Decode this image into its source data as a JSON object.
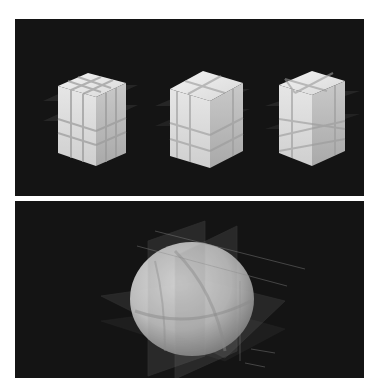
{
  "figure": {
    "background": "#ffffff",
    "panel_background": "#141414",
    "panels": [
      {
        "id": "top",
        "description": "Three cubes sliced by translucent planes",
        "objects": [
          {
            "shape": "cube",
            "variant": "axis-aligned 3x3 slicing",
            "face_color": "#e6e6e6"
          },
          {
            "shape": "cube",
            "variant": "offset slicing planes",
            "face_color": "#e2e2e2"
          },
          {
            "shape": "cube",
            "variant": "diagonal slicing planes",
            "face_color": "#e4e4e4"
          }
        ]
      },
      {
        "id": "bottom",
        "description": "Ellipsoid/sphere sliced by translucent orthogonal planes",
        "objects": [
          {
            "shape": "sphere",
            "variant": "sliced by horizontal and vertical planes",
            "face_color": "#d8d8d8"
          }
        ]
      }
    ],
    "plane_color": "#9a9a9a"
  }
}
